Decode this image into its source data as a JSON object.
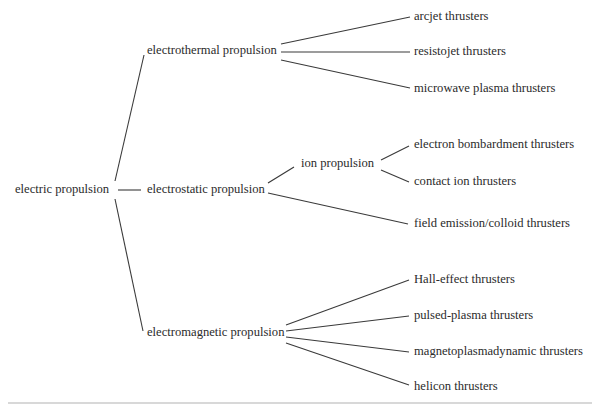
{
  "diagram": {
    "type": "tree",
    "root": {
      "id": "root",
      "label": "electric propulsion",
      "x": 15,
      "y": 190,
      "children": [
        {
          "id": "electrothermal",
          "label": "electrothermal propulsion",
          "x": 147,
          "y": 51,
          "children": [
            {
              "id": "arcjet",
              "label": "arcjet thrusters",
              "x": 414,
              "y": 17
            },
            {
              "id": "resistojet",
              "label": "resistojet thrusters",
              "x": 414,
              "y": 52
            },
            {
              "id": "microwave",
              "label": "microwave plasma thrusters",
              "x": 414,
              "y": 89
            }
          ]
        },
        {
          "id": "electrostatic",
          "label": "electrostatic propulsion",
          "x": 147,
          "y": 190,
          "children": [
            {
              "id": "ion",
              "label": "ion propulsion",
              "x": 301,
              "y": 164,
              "children": [
                {
                  "id": "electron-bombardment",
                  "label": "electron bombardment thrusters",
                  "x": 414,
                  "y": 145
                },
                {
                  "id": "contact-ion",
                  "label": "contact ion thrusters",
                  "x": 414,
                  "y": 182
                }
              ]
            },
            {
              "id": "field-emission",
              "label": "field emission/colloid thrusters",
              "x": 414,
              "y": 224
            }
          ]
        },
        {
          "id": "electromagnetic",
          "label": "electromagnetic propulsion",
          "x": 147,
          "y": 333,
          "children": [
            {
              "id": "hall",
              "label": "Hall-effect thrusters",
              "x": 414,
              "y": 280
            },
            {
              "id": "pulsed-plasma",
              "label": "pulsed-plasma thrusters",
              "x": 414,
              "y": 316
            },
            {
              "id": "mpd",
              "label": "magnetoplasmadynamic thrusters",
              "x": 414,
              "y": 352
            },
            {
              "id": "helicon",
              "label": "helicon thrusters",
              "x": 414,
              "y": 387
            }
          ]
        }
      ]
    },
    "edges": [
      {
        "from": "root",
        "to": "electrothermal",
        "x1": 115,
        "y1": 181,
        "x2": 144,
        "y2": 55
      },
      {
        "from": "root",
        "to": "electrostatic",
        "x1": 118,
        "y1": 190,
        "x2": 141,
        "y2": 190
      },
      {
        "from": "root",
        "to": "electromagnetic",
        "x1": 115,
        "y1": 199,
        "x2": 143,
        "y2": 331
      },
      {
        "from": "electrothermal",
        "to": "arcjet",
        "x1": 281,
        "y1": 44,
        "x2": 410,
        "y2": 17
      },
      {
        "from": "electrothermal",
        "to": "resistojet",
        "x1": 281,
        "y1": 52,
        "x2": 410,
        "y2": 52
      },
      {
        "from": "electrothermal",
        "to": "microwave",
        "x1": 281,
        "y1": 60,
        "x2": 410,
        "y2": 88
      },
      {
        "from": "electrostatic",
        "to": "ion",
        "x1": 268,
        "y1": 183,
        "x2": 294,
        "y2": 167
      },
      {
        "from": "electrostatic",
        "to": "field-emission",
        "x1": 268,
        "y1": 193,
        "x2": 408,
        "y2": 224
      },
      {
        "from": "ion",
        "to": "electron-bombardment",
        "x1": 381,
        "y1": 160,
        "x2": 409,
        "y2": 146
      },
      {
        "from": "ion",
        "to": "contact-ion",
        "x1": 381,
        "y1": 170,
        "x2": 409,
        "y2": 182
      },
      {
        "from": "electromagnetic",
        "to": "hall",
        "x1": 286,
        "y1": 325,
        "x2": 409,
        "y2": 280
      },
      {
        "from": "electromagnetic",
        "to": "pulsed-plasma",
        "x1": 286,
        "y1": 331,
        "x2": 409,
        "y2": 316
      },
      {
        "from": "electromagnetic",
        "to": "mpd",
        "x1": 286,
        "y1": 337,
        "x2": 409,
        "y2": 352
      },
      {
        "from": "electromagnetic",
        "to": "helicon",
        "x1": 286,
        "y1": 343,
        "x2": 409,
        "y2": 385
      }
    ]
  },
  "colors": {
    "text": "#2b2b2b",
    "line": "#3a3a3a",
    "background": "#ffffff",
    "rule": "#d8d8d8"
  }
}
